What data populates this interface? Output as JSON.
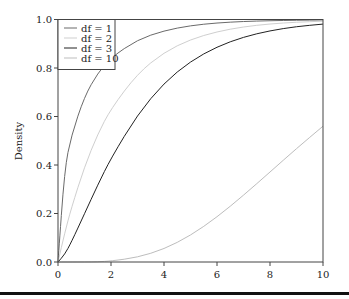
{
  "chart_data": {
    "type": "line",
    "title": "",
    "xlabel": "",
    "ylabel": "Density",
    "xlim": [
      0,
      10
    ],
    "ylim": [
      0,
      1
    ],
    "grid": false,
    "legend_position": "upper left",
    "x_ticks": [
      "0",
      "2",
      "4",
      "6",
      "8",
      "10"
    ],
    "y_ticks": [
      "0.0",
      "0.2",
      "0.4",
      "0.6",
      "0.8",
      "1.0"
    ],
    "x": [
      0,
      0.25,
      0.5,
      1,
      1.5,
      2,
      3,
      4,
      5,
      6,
      7,
      8,
      9,
      10
    ],
    "series": [
      {
        "name": "df = 1",
        "color": "#6a6a6a",
        "values": [
          0,
          0.383,
          0.52,
          0.683,
          0.779,
          0.843,
          0.917,
          0.954,
          0.975,
          0.986,
          0.992,
          0.995,
          0.997,
          0.998
        ]
      },
      {
        "name": "df = 2",
        "color": "#cfcfcf",
        "values": [
          0,
          0.118,
          0.221,
          0.393,
          0.528,
          0.632,
          0.777,
          0.865,
          0.918,
          0.95,
          0.97,
          0.982,
          0.989,
          0.993
        ]
      },
      {
        "name": "df = 3",
        "color": "#222222",
        "values": [
          0,
          0.031,
          0.081,
          0.199,
          0.318,
          0.428,
          0.608,
          0.739,
          0.828,
          0.888,
          0.928,
          0.954,
          0.971,
          0.981
        ]
      },
      {
        "name": "df = 10",
        "color": "#bdbdbd",
        "values": [
          0,
          0,
          0,
          0.0002,
          0.0008,
          0.004,
          0.019,
          0.053,
          0.109,
          0.185,
          0.275,
          0.371,
          0.468,
          0.56
        ]
      }
    ]
  }
}
